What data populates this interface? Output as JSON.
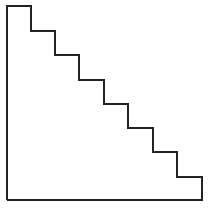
{
  "diagram": {
    "type": "staircase-outline",
    "background": "#ffffff",
    "stroke_color": "#222222",
    "stroke_width": 2,
    "step_count": 8,
    "points": [
      [
        7,
        200
      ],
      [
        7,
        6
      ],
      [
        31,
        6
      ],
      [
        31,
        31
      ],
      [
        55,
        31
      ],
      [
        55,
        55
      ],
      [
        79,
        55
      ],
      [
        79,
        80
      ],
      [
        104,
        80
      ],
      [
        104,
        104
      ],
      [
        128,
        104
      ],
      [
        128,
        128
      ],
      [
        153,
        128
      ],
      [
        153,
        152
      ],
      [
        177,
        152
      ],
      [
        177,
        177
      ],
      [
        202,
        177
      ],
      [
        202,
        200
      ],
      [
        7,
        200
      ]
    ]
  }
}
